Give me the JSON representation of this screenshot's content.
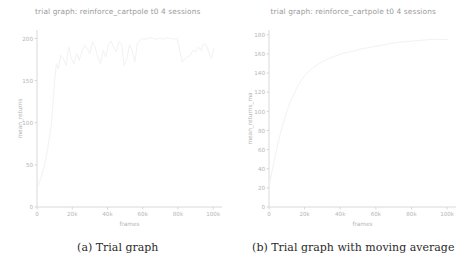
{
  "figure": {
    "panels": [
      {
        "id": "panel-a",
        "title": "trial graph: reinforce_cartpole t0 4 sessions",
        "caption": "(a) Trial graph",
        "caption_label": "(a)",
        "caption_text": "Trial graph"
      },
      {
        "id": "panel-b",
        "title": "trial graph: reinforce_cartpole t0 4 sessions",
        "caption": "(b) Trial graph with moving average",
        "caption_label": "(b)",
        "caption_text": "Trial graph with moving average"
      }
    ],
    "line_color": "#f2f2f2",
    "axis_color": "#cfcfcf",
    "tick_text_color": "#b5b5b5",
    "title_color": "#9a9a9a",
    "caption_color": "#2b2b2b"
  },
  "chart_data": [
    {
      "type": "line",
      "id": "trial-graph",
      "title": "trial graph: reinforce_cartpole t0 4 sessions",
      "xlabel": "frames",
      "ylabel": "mean_returns",
      "xlim": [
        0,
        105000
      ],
      "ylim": [
        0,
        210
      ],
      "grid": false,
      "legend": "none",
      "xticks": [
        0,
        20000,
        40000,
        60000,
        80000,
        100000
      ],
      "xticklabels": [
        "0",
        "20k",
        "40k",
        "60k",
        "80k",
        "100k"
      ],
      "yticks": [
        0,
        50,
        100,
        150,
        200
      ],
      "yticklabels": [
        "0",
        "50",
        "100",
        "150",
        "200"
      ],
      "series": [
        {
          "name": "mean_returns",
          "x": [
            0,
            1500,
            3000,
            4500,
            6000,
            7000,
            8000,
            9000,
            10000,
            11000,
            12000,
            13500,
            15000,
            16500,
            18000,
            19500,
            21000,
            22500,
            24000,
            25500,
            27000,
            28500,
            30000,
            31500,
            33000,
            34500,
            36000,
            37500,
            39000,
            40500,
            42000,
            43500,
            45000,
            46500,
            48000,
            49500,
            51000,
            52500,
            54000,
            55500,
            57000,
            58500,
            60000,
            61500,
            63000,
            64500,
            66000,
            67500,
            69000,
            70500,
            72000,
            73500,
            75000,
            76500,
            78000,
            79500,
            81000,
            82500,
            84000,
            85500,
            87000,
            88500,
            90000,
            91500,
            93000,
            94500,
            96000,
            97500,
            99000,
            100500
          ],
          "y": [
            22,
            30,
            40,
            52,
            68,
            82,
            95,
            120,
            150,
            170,
            164,
            180,
            176,
            168,
            190,
            176,
            170,
            182,
            174,
            185,
            192,
            188,
            182,
            196,
            190,
            178,
            170,
            186,
            178,
            192,
            197,
            190,
            184,
            196,
            193,
            168,
            176,
            192,
            186,
            172,
            194,
            198,
            200,
            199,
            200,
            201,
            200,
            199,
            200,
            200,
            199,
            201,
            200,
            200,
            199,
            200,
            186,
            172,
            176,
            178,
            180,
            186,
            184,
            190,
            186,
            194,
            192,
            184,
            176,
            189
          ]
        }
      ]
    },
    {
      "type": "line",
      "id": "trial-graph-ma",
      "title": "trial graph: reinforce_cartpole t0 4 sessions",
      "xlabel": "frames",
      "ylabel": "mean_returns_ma",
      "xlim": [
        0,
        105000
      ],
      "ylim": [
        0,
        185
      ],
      "grid": false,
      "legend": "none",
      "xticks": [
        0,
        20000,
        40000,
        60000,
        80000,
        100000
      ],
      "xticklabels": [
        "0",
        "20k",
        "40k",
        "60k",
        "80k",
        "100k"
      ],
      "yticks": [
        0,
        20,
        40,
        60,
        80,
        100,
        120,
        140,
        160,
        180
      ],
      "yticklabels": [
        "0",
        "20",
        "40",
        "60",
        "80",
        "100",
        "120",
        "140",
        "160",
        "180"
      ],
      "series": [
        {
          "name": "mean_returns_ma",
          "x": [
            0,
            2000,
            4000,
            6000,
            8000,
            10000,
            12000,
            14000,
            16000,
            18000,
            20000,
            22500,
            25000,
            27500,
            30000,
            33000,
            36000,
            39000,
            42000,
            45000,
            48000,
            51000,
            54000,
            57000,
            60000,
            63000,
            66000,
            69000,
            72000,
            75000,
            78000,
            81000,
            84000,
            87000,
            90000,
            93000,
            96000,
            99000,
            100500
          ],
          "y": [
            22,
            40,
            58,
            74,
            88,
            100,
            110,
            118,
            126,
            132,
            137,
            142,
            146,
            149,
            152,
            155,
            157,
            159,
            161,
            162,
            163,
            165,
            166,
            167,
            168,
            169,
            170,
            171,
            172,
            172.5,
            173,
            173.5,
            174,
            174.5,
            175,
            175,
            175,
            175,
            175
          ]
        }
      ]
    }
  ]
}
